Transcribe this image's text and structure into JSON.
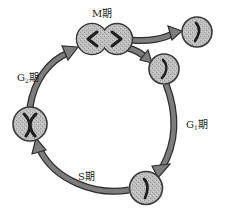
{
  "diagram": {
    "type": "cell-cycle",
    "colors": {
      "cell_fill": "#b9b9b9",
      "cell_outline": "#3a3a3a",
      "arrow_fill": "#7d7d7d",
      "arrow_outline": "#2e2e2e",
      "chromosome": "#1e1e1e",
      "background": "#ffffff"
    },
    "labels": {
      "m_phase": "M期",
      "g1_phase_letter": "G",
      "g1_phase_sub": "1",
      "g1_phase_suffix": "期",
      "g2_phase_letter": "G",
      "g2_phase_sub": "2",
      "g2_phase_suffix": "期",
      "s_phase": "S期"
    },
    "cells": [
      {
        "id": "m-phase-cell",
        "shape": "dividing-dumbbell",
        "chromosomes": "separating-pair"
      },
      {
        "id": "daughter-cell-exit",
        "shape": "circle",
        "chromosome": "single"
      },
      {
        "id": "g1-cell",
        "shape": "circle",
        "chromosome": "single"
      },
      {
        "id": "s-phase-cell",
        "shape": "circle",
        "chromosome": "single"
      },
      {
        "id": "g2-cell",
        "shape": "circle",
        "chromosome": "replicated-x"
      }
    ],
    "arrows": [
      {
        "from": "m-phase-cell",
        "to": "daughter-cell-exit"
      },
      {
        "from": "m-phase-cell",
        "to": "g1-cell"
      },
      {
        "from": "g1-cell",
        "to": "s-phase-cell",
        "phase": "G1"
      },
      {
        "from": "s-phase-cell",
        "to": "g2-cell",
        "phase": "S"
      },
      {
        "from": "g2-cell",
        "to": "m-phase-cell",
        "phase": "G2"
      }
    ]
  }
}
